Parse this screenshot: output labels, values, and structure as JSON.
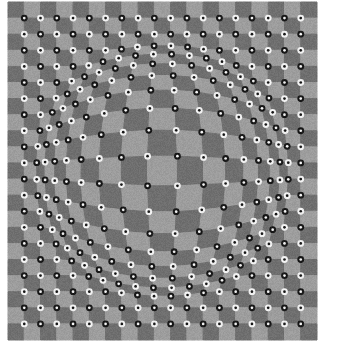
{
  "figure": {
    "type": "optical-illusion-pattern",
    "canvas_width": 347,
    "canvas_height": 354,
    "background_color": "#ffffff"
  },
  "pattern": {
    "name": "bulge-checkerboard",
    "plot_left": 8,
    "plot_top": 2,
    "plot_width": 309,
    "plot_height": 338,
    "cell_size": 16.6,
    "columns": 19,
    "rows": 21,
    "light_color": "#9d9d9d",
    "dark_color": "#6f6f6f",
    "noise_amount": 7
  },
  "dots": {
    "name": "corner-dots",
    "radius": 3.4,
    "inner_radius": 1.35,
    "black_color": "#171717",
    "white_color": "#f2f2f2",
    "pairing": "alternating-diagonal",
    "count_per_row": 19,
    "count_per_column": 21
  },
  "distortion": {
    "name": "radial-bulge",
    "center_x": 0.5,
    "center_y": 0.5,
    "inner_radius_fraction": 0.08,
    "outer_radius_fraction": 0.42,
    "strength": 0.38,
    "swirl": 0.0,
    "description": "Radial outward displacement of the checkerboard lattice within the central disc producing an apparent bulge."
  },
  "chart_data": {
    "type": "heatmap",
    "xlabel": "",
    "ylabel": "",
    "grid": false,
    "legend": "none",
    "categories": [
      "light-square",
      "dark-square",
      "black-dot",
      "white-dot"
    ],
    "values": [
      199,
      200,
      199,
      200
    ]
  }
}
